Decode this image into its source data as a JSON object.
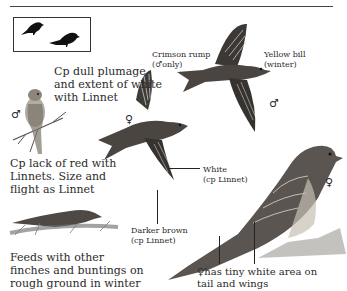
{
  "page": {
    "header_rule": true,
    "silhouette_box": {
      "description": "two finch silhouettes, perched and feeding"
    }
  },
  "annotations": {
    "crimson_rump": {
      "line1": "Crimson rump",
      "line2": "(♂only)"
    },
    "yellow_bill": {
      "line1": "Yellow bill",
      "line2": "(winter)"
    },
    "cp_dull": {
      "line1": "Cp dull plumage",
      "line2": "and extent of white",
      "line3": "with Linnet"
    },
    "cp_lack": {
      "line1": "Cp lack of red with",
      "line2": "Linnets. Size and",
      "line3": "flight as Linnet"
    },
    "white": {
      "line1": "White",
      "line2": "(cp Linnet)"
    },
    "darker_brown": {
      "line1": "Darker brown",
      "line2": "(cp Linnet)"
    },
    "feeds": {
      "line1": "Feeds with other",
      "line2": "finches and buntings on",
      "line3": "rough ground in winter"
    },
    "female_tail": {
      "line1": "♀has tiny white area on",
      "line2": "tail and wings"
    }
  },
  "symbols": {
    "male_perched": "♂",
    "female_flight": "♀",
    "male_flight": "♂",
    "female_perched": "♀"
  },
  "colors": {
    "ink": "#2a2a2a",
    "bird_dark": "#3a3a3a",
    "bird_mid": "#6b6660",
    "bird_light": "#a9a39a"
  }
}
